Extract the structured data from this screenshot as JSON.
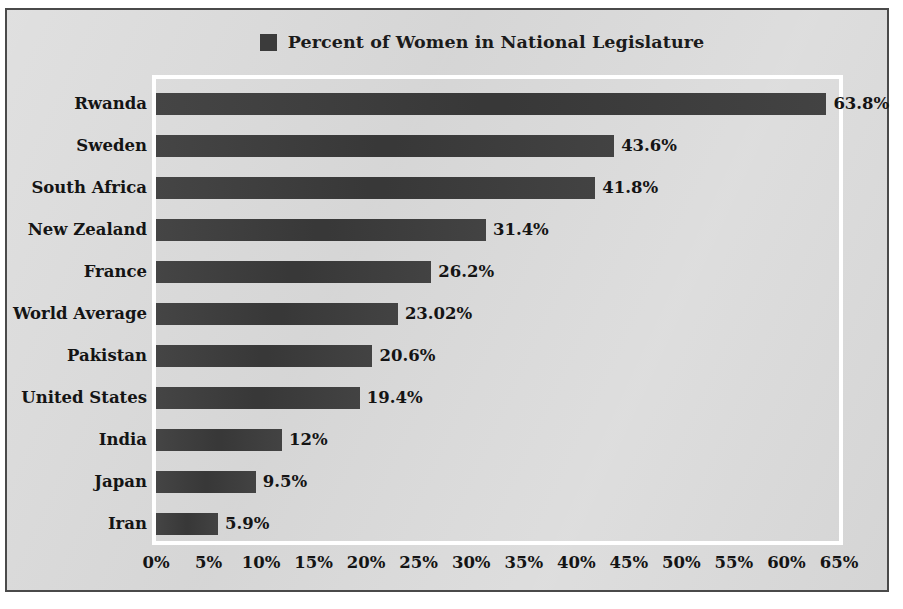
{
  "chart_data": {
    "type": "bar",
    "orientation": "horizontal",
    "title": "",
    "xlabel": "",
    "ylabel": "",
    "legend": [
      "Percent of Women in National Legislature"
    ],
    "legend_position": "top-center",
    "grid": false,
    "xlim": [
      0,
      65
    ],
    "xticks": [
      "0%",
      "5%",
      "10%",
      "15%",
      "20%",
      "25%",
      "30%",
      "35%",
      "40%",
      "45%",
      "50%",
      "55%",
      "60%",
      "65%"
    ],
    "xtick_values": [
      0,
      5,
      10,
      15,
      20,
      25,
      30,
      35,
      40,
      45,
      50,
      55,
      60,
      65
    ],
    "categories": [
      "Rwanda",
      "Sweden",
      "South Africa",
      "New Zealand",
      "France",
      "World Average",
      "Pakistan",
      "United States",
      "India",
      "Japan",
      "Iran"
    ],
    "values": [
      63.8,
      43.6,
      41.8,
      31.4,
      26.2,
      23.02,
      20.6,
      19.4,
      12,
      9.5,
      5.9
    ],
    "data_labels": [
      "63.8%",
      "43.6%",
      "41.8%",
      "31.4%",
      "26.2%",
      "23.02%",
      "20.6%",
      "19.4%",
      "12%",
      "9.5%",
      "5.9%"
    ],
    "series": [
      {
        "name": "Percent of Women in National Legislature",
        "values": [
          63.8,
          43.6,
          41.8,
          31.4,
          26.2,
          23.02,
          20.6,
          19.4,
          12,
          9.5,
          5.9
        ]
      }
    ]
  },
  "colors": {
    "bar": "#3b3b3b",
    "chart_background": "#d9d9d9",
    "frame_border": "#4a4a4a",
    "plot_border": "#ffffff",
    "text": "#141414"
  }
}
